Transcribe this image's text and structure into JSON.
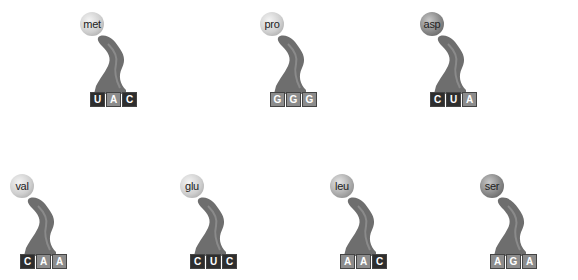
{
  "trnas": [
    {
      "amino_acid": "met",
      "anticodon": [
        "U",
        "A",
        "C"
      ],
      "shades": [
        "dark",
        "light",
        "dark"
      ],
      "ball": "light",
      "x": 78,
      "y": 10
    },
    {
      "amino_acid": "pro",
      "anticodon": [
        "G",
        "G",
        "G"
      ],
      "shades": [
        "light",
        "light",
        "light"
      ],
      "ball": "light",
      "x": 258,
      "y": 10
    },
    {
      "amino_acid": "asp",
      "anticodon": [
        "C",
        "U",
        "A"
      ],
      "shades": [
        "dark",
        "dark",
        "light"
      ],
      "ball": "dark",
      "x": 418,
      "y": 10
    },
    {
      "amino_acid": "val",
      "anticodon": [
        "C",
        "A",
        "A"
      ],
      "shades": [
        "dark",
        "light",
        "light"
      ],
      "ball": "light",
      "x": 8,
      "y": 172
    },
    {
      "amino_acid": "glu",
      "anticodon": [
        "C",
        "U",
        "C"
      ],
      "shades": [
        "dark",
        "dark",
        "dark"
      ],
      "ball": "light",
      "x": 178,
      "y": 172
    },
    {
      "amino_acid": "leu",
      "anticodon": [
        "A",
        "A",
        "C"
      ],
      "shades": [
        "light",
        "light",
        "dark"
      ],
      "ball": "mid",
      "x": 328,
      "y": 172
    },
    {
      "amino_acid": "ser",
      "anticodon": [
        "A",
        "G",
        "A"
      ],
      "shades": [
        "light",
        "light",
        "light"
      ],
      "ball": "dark",
      "x": 478,
      "y": 172
    }
  ]
}
